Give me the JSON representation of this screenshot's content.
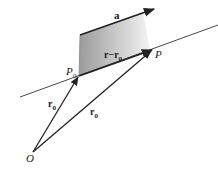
{
  "diagram": {
    "type": "vector-line-geometry",
    "labels": {
      "direction_vector": "a",
      "difference_vector": "r−r",
      "difference_sub": "0",
      "point_p0": "P",
      "point_p0_sub": "0",
      "point_p": "P",
      "origin": "O",
      "vector_r0_left": "r",
      "vector_r0_left_sub": "0",
      "vector_r0_right": "r",
      "vector_r0_right_sub": "0"
    },
    "colors": {
      "stroke": "#2a2a2a",
      "shade_dark": "#9a9a9a",
      "shade_light": "#f2f2f2"
    }
  }
}
